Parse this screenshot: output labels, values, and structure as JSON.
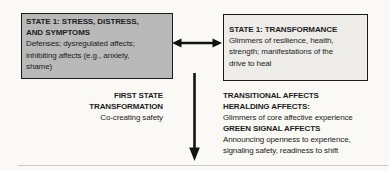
{
  "left_box": {
    "title": [
      "STATE 1: STRESS, DISTRESS,",
      "AND SYMPTOMS"
    ],
    "body": [
      "Defenses; dysregulated affects;",
      "inhibiting affects (e.g., anxiety,",
      "shame)"
    ]
  },
  "right_box": {
    "title": [
      "STATE 1: TRANSFORMANCE"
    ],
    "body": [
      "Glimmers of resilience, health,",
      "strength; manifestations of the",
      "drive to heal"
    ]
  },
  "left_label": {
    "heading": [
      "FIRST STATE",
      "TRANSFORMATION"
    ],
    "body": [
      "Co-creating safety"
    ]
  },
  "right_label": {
    "lines": [
      "TRANSITIONAL AFFECTS",
      "HERALDING AFFECTS:",
      "Glimmers of core affective experience",
      "GREEN SIGNAL AFFECTS",
      "Announcing openness to experience,",
      "signaling safety, readiness to shift"
    ]
  },
  "icons": {
    "between_boxes": "bidirectional-arrow-icon",
    "state_shift": "down-arrow-icon"
  },
  "colors": {
    "page-bg": "#faf9f6",
    "left-box-fill": "#b9b9b9",
    "right-box-fill": "#edece9",
    "box-border": "#1a1a1a",
    "arrow": "#121212",
    "rule": "#c9c9c6",
    "text": "#1c1c1c"
  }
}
